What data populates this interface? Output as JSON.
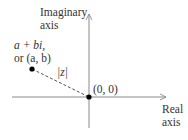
{
  "diagram": {
    "imaginary_axis_label": [
      "Imaginary",
      "axis"
    ],
    "real_axis_label": [
      "Real",
      "axis"
    ],
    "point_label_line1": "a + bi,",
    "point_label_line2": "or (a, b)",
    "origin_label": "(0, 0)",
    "modulus_label": "|z|",
    "colors": {
      "axis": "#8a8a8a",
      "point": "#000000",
      "dashed": "#555555",
      "text": "#333333"
    }
  }
}
